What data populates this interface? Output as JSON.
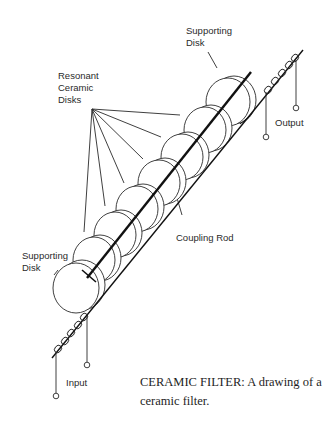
{
  "labels": {
    "supporting_disk_top": "Supporting\nDisk",
    "resonant_disks": "Resonant\nCeramic\nDisks",
    "output": "Output",
    "coupling_rod": "Coupling Rod",
    "supporting_disk_bottom": "Supporting\nDisk",
    "input": "Input"
  },
  "caption": "CERAMIC FILTER: A drawing of a ceramic filter.",
  "colors": {
    "ink": "#1e1e1e",
    "background": "#ffffff"
  }
}
